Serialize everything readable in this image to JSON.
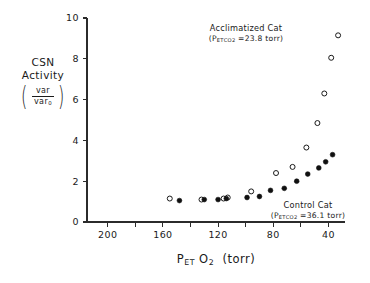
{
  "chart_data": {
    "type": "scatter",
    "title": "",
    "xlabel": "P_ET O2 (torr)",
    "ylabel": "CSN Activity (var/var0)",
    "xlim": [
      215,
      28
    ],
    "ylim": [
      0,
      10
    ],
    "x_reversed": true,
    "grid": false,
    "legend_position": "in-plot annotations",
    "xticks": [
      200,
      180,
      160,
      140,
      120,
      100,
      80,
      60,
      40
    ],
    "xtick_labels": [
      "200",
      "",
      "160",
      "",
      "120",
      "",
      "80",
      "",
      "40"
    ],
    "yticks": [
      0,
      2,
      4,
      6,
      8,
      10
    ],
    "ytick_labels": [
      "0",
      "2",
      "4",
      "6",
      "8",
      "10"
    ],
    "series": [
      {
        "name": "Acclimatized Cat",
        "marker": "open-circle",
        "color": "#1a1a1a",
        "points": [
          {
            "x": 155,
            "y": 1.15
          },
          {
            "x": 132,
            "y": 1.1
          },
          {
            "x": 116,
            "y": 1.15
          },
          {
            "x": 113,
            "y": 1.2
          },
          {
            "x": 96,
            "y": 1.5
          },
          {
            "x": 78,
            "y": 2.4
          },
          {
            "x": 66,
            "y": 2.7
          },
          {
            "x": 56,
            "y": 3.65
          },
          {
            "x": 48,
            "y": 4.85
          },
          {
            "x": 43,
            "y": 6.3
          },
          {
            "x": 38,
            "y": 8.05
          },
          {
            "x": 33,
            "y": 9.15
          }
        ]
      },
      {
        "name": "Control Cat",
        "marker": "filled-circle",
        "color": "#101010",
        "points": [
          {
            "x": 148,
            "y": 1.05
          },
          {
            "x": 130,
            "y": 1.1
          },
          {
            "x": 120,
            "y": 1.1
          },
          {
            "x": 114,
            "y": 1.15
          },
          {
            "x": 99,
            "y": 1.2
          },
          {
            "x": 90,
            "y": 1.25
          },
          {
            "x": 82,
            "y": 1.55
          },
          {
            "x": 72,
            "y": 1.65
          },
          {
            "x": 63,
            "y": 2.0
          },
          {
            "x": 55,
            "y": 2.35
          },
          {
            "x": 47,
            "y": 2.65
          },
          {
            "x": 42,
            "y": 2.95
          },
          {
            "x": 37,
            "y": 3.3
          }
        ]
      }
    ],
    "annotations": [
      {
        "id": "acclimatized",
        "line1": "Acclimatized Cat",
        "line2_prefix": "(P",
        "line2_sub1": "ET",
        "line2_sub2": "CO",
        "line2_sub3": "2",
        "line2_value": " =23.8 torr)"
      },
      {
        "id": "control",
        "line1": "Control Cat",
        "line2_prefix": "(P",
        "line2_sub1": "ET",
        "line2_sub2": "CO",
        "line2_sub3": "2",
        "line2_value": " =36.1 torr)"
      }
    ]
  },
  "axes": {
    "y_label_line1": "CSN",
    "y_label_line2": "Activity",
    "y_fraction_numerator": "var",
    "y_fraction_denominator": "var",
    "y_fraction_denominator_sub": "0",
    "x_label_main": "P",
    "x_label_sub": "ET",
    "x_label_species": "O",
    "x_label_species_sub": "2",
    "x_label_units": "(torr)"
  },
  "annotation_acclimatized": {
    "line1": "Acclimatized Cat",
    "value": "=23.8 torr)"
  },
  "annotation_control": {
    "line1": "Control Cat",
    "value": "=36.1 torr)"
  }
}
